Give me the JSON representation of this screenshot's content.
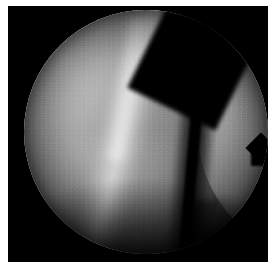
{
  "image": {
    "kind": "arthroscopic-photograph",
    "modality_label": "Arthroscopy",
    "alt_text": "Grayscale arthroscopic view of a joint: a circular endoscopic field of view showing two smooth cartilage-covered tissue surfaces separated by a dark vertical cleft, with a bright specular highlight along the left surface.",
    "frame": {
      "matte_color": "#ffffff",
      "background_color": "#000000",
      "field_of_view_shape": "circle"
    },
    "palette": {
      "matte": "#ffffff",
      "letterbox": "#000000",
      "highlight_peak": "#d8d8d8",
      "left_mass_light": "#b6b6b6",
      "left_mass_mid": "#8a8a8a",
      "left_mass_dark": "#4a4a4a",
      "right_mass_mid": "#8a8a8a",
      "right_mass_dark": "#3a3a3a",
      "cleft": "#000000",
      "vignette": "#141414",
      "shadow_bottom": "#050505"
    },
    "regions": [
      {
        "id": "left-mass",
        "label": "Left tissue surface",
        "description": "Large convex cartilage surface occupying the left two-thirds of the field, brightest at upper-left and shading to near black toward the lower border."
      },
      {
        "id": "specular-ridge",
        "label": "Specular highlight ridge",
        "description": "Bright near-white diagonal streak running from the upper edge down and slightly right across the left surface."
      },
      {
        "id": "cleft",
        "label": "Dark cleft",
        "description": "Near-black vertical gap separating the left and right tissue surfaces, widening into a dark wedge toward the upper right."
      },
      {
        "id": "right-mass",
        "label": "Right tissue surface",
        "description": "Crescent-shaped surface along the right side of the field, uniformly mid-gray, tapering to a point at the bottom."
      },
      {
        "id": "notch",
        "label": "Contour notch",
        "description": "Small step-shaped notch cut into the right-hand contour of the right tissue surface, slightly below the vertical midline."
      },
      {
        "id": "vignette",
        "label": "Scope vignette",
        "description": "Circular falloff to black at the perimeter of the endoscope field of view, heaviest along the bottom."
      }
    ]
  }
}
